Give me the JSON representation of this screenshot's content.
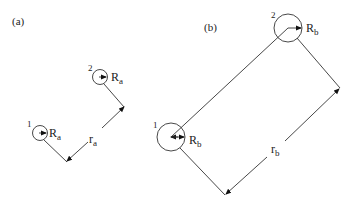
{
  "panels": {
    "a": {
      "label": "(a)",
      "sphere1": {
        "index": "1",
        "radius_label": "R",
        "radius_sub": "a"
      },
      "sphere2": {
        "index": "2",
        "radius_label": "R",
        "radius_sub": "a"
      },
      "separation": {
        "label": "r",
        "sub": "a"
      }
    },
    "b": {
      "label": "(b)",
      "sphere1": {
        "index": "1",
        "radius_label": "R",
        "radius_sub": "b"
      },
      "sphere2": {
        "index": "2",
        "radius_label": "R",
        "radius_sub": "b"
      },
      "separation": {
        "label": "r",
        "sub": "b"
      }
    }
  }
}
